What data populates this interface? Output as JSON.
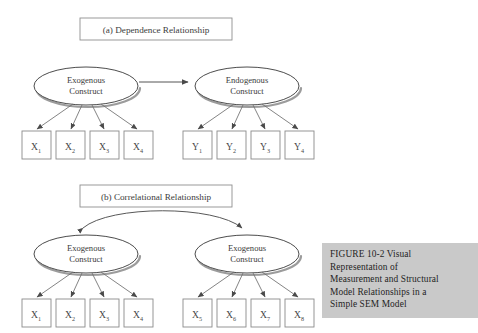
{
  "figure": {
    "caption": "FIGURE 10-2    Visual\nRepresentation of\nMeasurement and Structural\nModel Relationships in a\nSimple SEM Model",
    "background_color": "#ffffff",
    "caption_background_color": "#c9c9c9"
  },
  "panels": [
    {
      "id": "panel-a",
      "title": "(a) Dependence Relationship",
      "relationship_type": "dependence",
      "constructs": [
        {
          "id": "exogenous-a",
          "line1": "Exogenous",
          "line2": "Construct",
          "indicators": [
            {
              "base": "X",
              "sub": "1"
            },
            {
              "base": "X",
              "sub": "2"
            },
            {
              "base": "X",
              "sub": "3"
            },
            {
              "base": "X",
              "sub": "4"
            }
          ]
        },
        {
          "id": "endogenous-a",
          "line1": "Endogenous",
          "line2": "Construct",
          "indicators": [
            {
              "base": "Y",
              "sub": "1"
            },
            {
              "base": "Y",
              "sub": "2"
            },
            {
              "base": "Y",
              "sub": "3"
            },
            {
              "base": "Y",
              "sub": "4"
            }
          ]
        }
      ],
      "connector": "single-headed-straight-arrow"
    },
    {
      "id": "panel-b",
      "title": "(b)  Correlational Relationship",
      "relationship_type": "correlational",
      "constructs": [
        {
          "id": "exogenous-b-left",
          "line1": "Exogenous",
          "line2": "Construct",
          "indicators": [
            {
              "base": "X",
              "sub": "1"
            },
            {
              "base": "X",
              "sub": "2"
            },
            {
              "base": "X",
              "sub": "3"
            },
            {
              "base": "X",
              "sub": "4"
            }
          ]
        },
        {
          "id": "exogenous-b-right",
          "line1": "Exogenous",
          "line2": "Construct",
          "indicators": [
            {
              "base": "X",
              "sub": "5"
            },
            {
              "base": "X",
              "sub": "6"
            },
            {
              "base": "X",
              "sub": "7"
            },
            {
              "base": "X",
              "sub": "8"
            }
          ]
        }
      ],
      "connector": "double-headed-curved-arrow"
    }
  ]
}
